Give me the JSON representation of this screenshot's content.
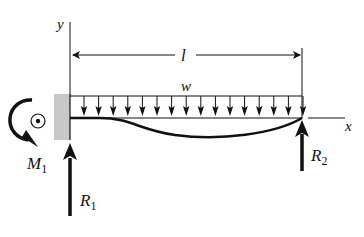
{
  "figure": {
    "type": "cantilever-propped beam under uniform distributed load",
    "labels": {
      "y_axis": "y",
      "x_axis": "x",
      "length": "l",
      "load": "w",
      "moment": "M",
      "moment_sub": "1",
      "reaction_left": "R",
      "reaction_left_sub": "1",
      "reaction_right": "R",
      "reaction_right_sub": "2"
    },
    "colors": {
      "ink": "#111111",
      "wall": "#c8c8c8",
      "background": "#ffffff"
    },
    "load_arrow_count": 16
  }
}
